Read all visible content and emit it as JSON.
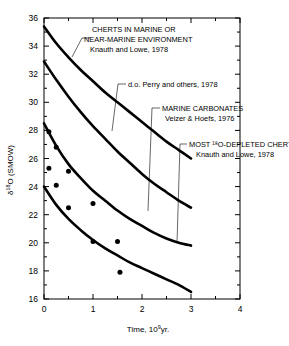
{
  "chart_data": {
    "type": "line",
    "title": "",
    "xlabel": "Time, 10⁹yr.",
    "ylabel": "δ¹⁸O (SMOW)",
    "xlim": [
      0,
      4
    ],
    "ylim": [
      16,
      36
    ],
    "grid": false,
    "legend_position": "inline-annotations",
    "xticks": [
      0,
      1,
      2,
      3,
      4
    ],
    "xticklabels": [
      "0",
      "1",
      "2",
      "3",
      "4"
    ],
    "xminor_step": 0.5,
    "yticks": [
      16,
      18,
      20,
      22,
      24,
      26,
      28,
      30,
      32,
      34,
      36
    ],
    "yticklabels": [
      "16",
      "18",
      "20",
      "22",
      "24",
      "26",
      "28",
      "30",
      "32",
      "34",
      "36"
    ],
    "yminor_step": 1,
    "series": [
      {
        "name": "CHERTS IN MARINE OR NEAR-MARINE ENVIRONMENT",
        "source": "Knauth and Lowe, 1978",
        "points": [
          [
            0,
            35.4
          ],
          [
            0.25,
            34.2
          ],
          [
            0.5,
            33.2
          ],
          [
            0.75,
            32.3
          ],
          [
            1.0,
            31.5
          ],
          [
            1.25,
            30.7
          ],
          [
            1.5,
            30.0
          ],
          [
            1.75,
            29.3
          ],
          [
            2.0,
            28.6
          ],
          [
            2.25,
            27.9
          ],
          [
            2.5,
            27.2
          ],
          [
            2.75,
            26.6
          ],
          [
            3.0,
            26.0
          ]
        ]
      },
      {
        "name": "d.o. Perry and others, 1978",
        "source": "Perry and others, 1978",
        "points": [
          [
            0,
            32.9
          ],
          [
            0.25,
            31.6
          ],
          [
            0.5,
            30.4
          ],
          [
            0.75,
            29.3
          ],
          [
            1.0,
            28.3
          ],
          [
            1.25,
            27.4
          ],
          [
            1.5,
            26.5
          ],
          [
            1.75,
            25.7
          ],
          [
            2.0,
            24.9
          ],
          [
            2.25,
            24.2
          ],
          [
            2.5,
            23.6
          ],
          [
            2.75,
            23.0
          ],
          [
            3.0,
            22.5
          ]
        ]
      },
      {
        "name": "MARINE CARBONATES",
        "source": "Veizer & Hoefs, 1976",
        "points": [
          [
            0,
            28.5
          ],
          [
            0.25,
            26.9
          ],
          [
            0.5,
            25.6
          ],
          [
            0.75,
            24.6
          ],
          [
            1.0,
            23.7
          ],
          [
            1.25,
            23.0
          ],
          [
            1.5,
            22.3
          ],
          [
            1.75,
            21.7
          ],
          [
            2.0,
            21.2
          ],
          [
            2.25,
            20.7
          ],
          [
            2.5,
            20.3
          ],
          [
            2.75,
            20.0
          ],
          [
            3.0,
            19.8
          ]
        ]
      },
      {
        "name": "MOST ¹⁸O-DEPLETED CHERTS",
        "source": "Knauth and Lowe, 1978",
        "points": [
          [
            0,
            24.0
          ],
          [
            0.25,
            22.7
          ],
          [
            0.5,
            21.7
          ],
          [
            0.75,
            20.9
          ],
          [
            1.0,
            20.2
          ],
          [
            1.25,
            19.6
          ],
          [
            1.5,
            19.1
          ],
          [
            1.75,
            18.6
          ],
          [
            2.0,
            18.2
          ],
          [
            2.25,
            17.8
          ],
          [
            2.5,
            17.4
          ],
          [
            2.75,
            17.0
          ],
          [
            3.0,
            16.5
          ]
        ]
      }
    ],
    "scatter": {
      "name": "chert samples",
      "marker": "filled-circle",
      "points": [
        [
          0.1,
          27.9
        ],
        [
          0.1,
          25.3
        ],
        [
          0.25,
          26.8
        ],
        [
          0.25,
          24.1
        ],
        [
          0.5,
          25.1
        ],
        [
          0.5,
          22.5
        ],
        [
          1.0,
          22.8
        ],
        [
          1.0,
          20.1
        ],
        [
          1.5,
          20.1
        ],
        [
          1.55,
          17.9
        ]
      ]
    },
    "annotations": [
      {
        "id": "cherts-marine",
        "lines": [
          "CHERTS IN MARINE OR",
          "NEAR-MARINE ENVIRONMENT",
          "Knauth and Lowe, 1978"
        ]
      },
      {
        "id": "perry",
        "lines": [
          "d.o. Perry and others, 1978"
        ]
      },
      {
        "id": "marine-carbonates",
        "lines": [
          "MARINE CARBONATES",
          "Veizer & Hoefs, 1976"
        ]
      },
      {
        "id": "depleted-cherts",
        "lines": [
          "MOST ¹⁸O-DEPLETED CHERTS",
          "Knauth and Lowe, 1978"
        ]
      }
    ]
  },
  "axes": {
    "y_label_main": "δ",
    "y_label_sup": "18",
    "y_label_rest": "O (SMOW)",
    "x_label_main": "Time, 10",
    "x_label_sup": "9",
    "x_label_rest": "yr."
  },
  "colors": {
    "curve": "#000000",
    "axis": "#000000",
    "background": "#ffffff",
    "marker": "#000000"
  }
}
